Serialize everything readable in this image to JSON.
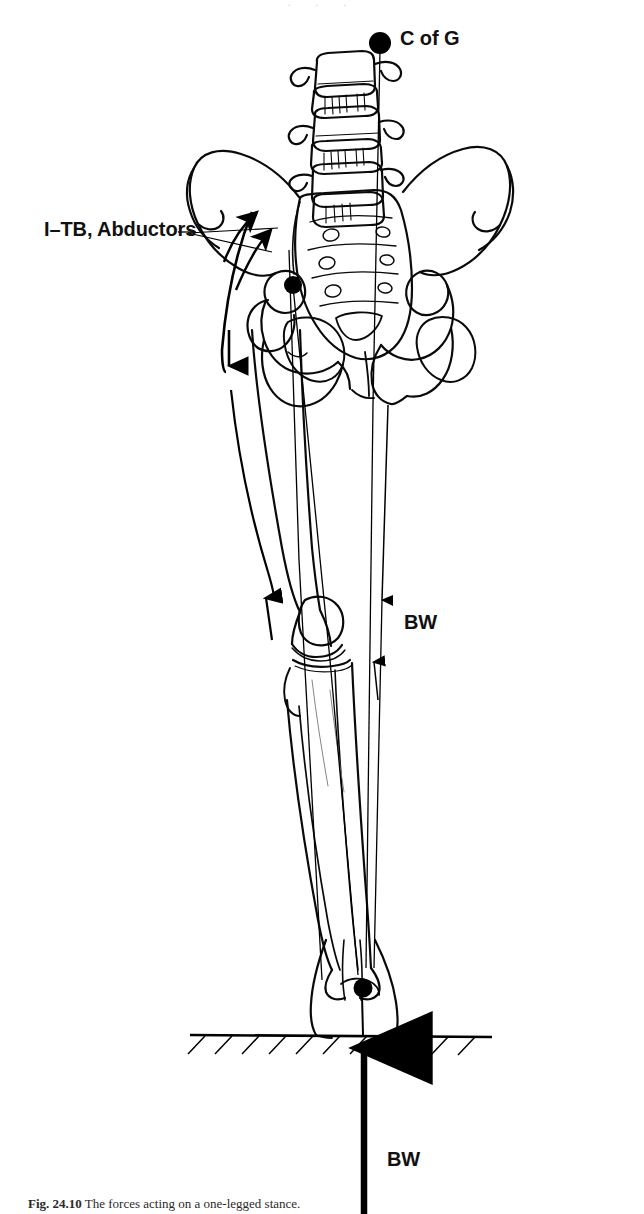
{
  "figure": {
    "domain_type": "anatomical-biomechanics-diagram",
    "background_color": "#ffffff",
    "ink_color": "#000000",
    "annotations": {
      "center_of_gravity": {
        "label": "C of G",
        "marker": "filled-dot",
        "marker_x": 380,
        "marker_y": 43,
        "label_x": 400,
        "label_y": 27
      },
      "itb_abductors": {
        "label": "I–TB, Abductors",
        "label_x": 44,
        "label_y": 218,
        "leader_lines": 2,
        "arrow_targets": [
          {
            "x": 258,
            "y": 210
          },
          {
            "x": 271,
            "y": 228
          }
        ]
      },
      "body_weight_upper": {
        "label": "BW",
        "label_x": 404,
        "label_y": 611,
        "line_top_y": 43,
        "line_bottom_y": 965,
        "arrowhead_down_y": 600,
        "arrowhead_up_y": 660
      },
      "body_weight_lower": {
        "label": "BW",
        "label_x": 387,
        "label_y": 1148,
        "arrow_direction": "up",
        "arrow_tip_y": 1035,
        "arrow_tail_y": 1214,
        "arrow_x": 364
      },
      "hip_joint_marker": {
        "name": "hip-joint-center",
        "marker": "filled-dot",
        "x": 293,
        "y": 285
      },
      "ankle_joint_marker": {
        "name": "ankle-joint-center",
        "marker": "filled-dot",
        "x": 363,
        "y": 988
      },
      "ground_line": {
        "name": "ground-surface",
        "y": 1035,
        "x_start": 190,
        "x_end": 492,
        "hatching": "diagonal-below",
        "hatch_count": 11
      }
    },
    "caption": {
      "number": "Fig. 24.10",
      "text": "The forces acting on a one-legged stance."
    },
    "top_bleed_text": "· · ·"
  }
}
